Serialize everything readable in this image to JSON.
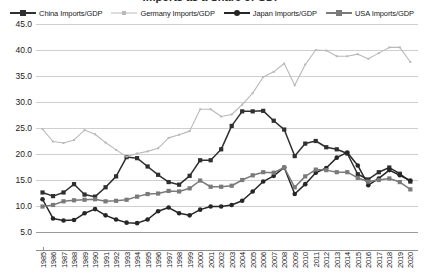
{
  "chart": {
    "title": "Imports as a Share of GDP",
    "type": "line"
  },
  "legend": {
    "position": "top",
    "items": [
      {
        "label": "China Imports/GDP",
        "color": "#2f2f2f",
        "marker": "square",
        "line": "solid"
      },
      {
        "label": "Germany Imports/GDP",
        "color": "#b9b9b9",
        "marker": "square-sm",
        "line": "solid"
      },
      {
        "label": "Japan Imports/GDP",
        "color": "#262626",
        "marker": "circle",
        "line": "solid"
      },
      {
        "label": "USA Imports/GDP",
        "color": "#7a7a7a",
        "marker": "square",
        "line": "solid"
      }
    ]
  },
  "yaxis": {
    "min": 5.0,
    "max": 45.0,
    "step": 5.0,
    "ticks": [
      "5.0",
      "10.0",
      "15.0",
      "20.0",
      "25.0",
      "30.0",
      "35.0",
      "40.0",
      "45.0"
    ],
    "label": ""
  },
  "xaxis": {
    "label": "",
    "ticks": [
      "1985",
      "1986",
      "1987",
      "1988",
      "1989",
      "1990",
      "1991",
      "1992",
      "1993",
      "1994",
      "1995",
      "1996",
      "1997",
      "1998",
      "1999",
      "2000",
      "2001",
      "2002",
      "2003",
      "2004",
      "2005",
      "2006",
      "2007",
      "2008",
      "2009",
      "2010",
      "2011",
      "2012",
      "2013",
      "2014",
      "2015",
      "2016",
      "2017",
      "2018",
      "2019",
      "2020"
    ]
  },
  "chart_data": {
    "type": "line",
    "title": "Imports as a Share of GDP",
    "xlabel": "",
    "ylabel": "",
    "ylim": [
      5.0,
      45.0
    ],
    "grid": true,
    "legend_position": "top",
    "categories": [
      "1985",
      "1986",
      "1987",
      "1988",
      "1989",
      "1990",
      "1991",
      "1992",
      "1993",
      "1994",
      "1995",
      "1996",
      "1997",
      "1998",
      "1999",
      "2000",
      "2001",
      "2002",
      "2003",
      "2004",
      "2005",
      "2006",
      "2007",
      "2008",
      "2009",
      "2010",
      "2011",
      "2012",
      "2013",
      "2014",
      "2015",
      "2016",
      "2017",
      "2018",
      "2019",
      "2020"
    ],
    "series": [
      {
        "name": "China Imports/GDP",
        "color": "#2f2f2f",
        "marker": "square",
        "values": [
          12.6,
          11.9,
          12.6,
          14.2,
          12.2,
          11.8,
          13.6,
          15.7,
          19.4,
          19.2,
          17.6,
          16.0,
          14.6,
          14.1,
          15.8,
          18.8,
          18.8,
          20.9,
          25.4,
          28.2,
          28.2,
          28.3,
          26.4,
          24.7,
          19.6,
          22.0,
          22.5,
          21.3,
          20.9,
          20.1,
          16.1,
          15.1,
          16.5,
          17.4,
          16.2,
          14.7
        ]
      },
      {
        "name": "Germany Imports/GDP",
        "color": "#b9b9b9",
        "marker": "square-sm",
        "values": [
          24.8,
          22.4,
          22.1,
          22.7,
          24.6,
          23.8,
          22.2,
          20.8,
          19.5,
          20.1,
          20.5,
          21.1,
          23.1,
          23.7,
          24.4,
          28.6,
          28.6,
          27.2,
          27.6,
          29.5,
          31.7,
          34.8,
          35.8,
          37.4,
          33.2,
          37.2,
          40.0,
          39.9,
          38.8,
          38.8,
          39.2,
          38.3,
          39.4,
          40.5,
          40.5,
          37.7
        ]
      },
      {
        "name": "Japan Imports/GDP",
        "color": "#262626",
        "marker": "circle",
        "values": [
          11.3,
          7.6,
          7.2,
          7.3,
          8.6,
          9.4,
          8.2,
          7.4,
          6.8,
          6.7,
          7.4,
          9.0,
          9.7,
          8.6,
          8.2,
          9.3,
          9.9,
          9.9,
          10.2,
          11.0,
          12.8,
          14.7,
          15.8,
          17.4,
          12.3,
          14.2,
          16.4,
          17.3,
          19.3,
          20.3,
          17.8,
          14.0,
          15.3,
          16.9,
          15.9,
          14.9
        ]
      },
      {
        "name": "USA Imports/GDP",
        "color": "#7a7a7a",
        "marker": "square",
        "values": [
          9.9,
          10.2,
          10.9,
          11.1,
          11.2,
          11.3,
          10.9,
          11.0,
          11.2,
          11.8,
          12.3,
          12.4,
          12.9,
          12.8,
          13.4,
          14.9,
          13.7,
          13.7,
          13.9,
          15.0,
          15.9,
          16.5,
          16.4,
          17.4,
          13.6,
          15.7,
          17.0,
          16.9,
          16.5,
          16.5,
          15.4,
          14.7,
          15.0,
          15.3,
          14.6,
          13.2
        ]
      }
    ]
  }
}
